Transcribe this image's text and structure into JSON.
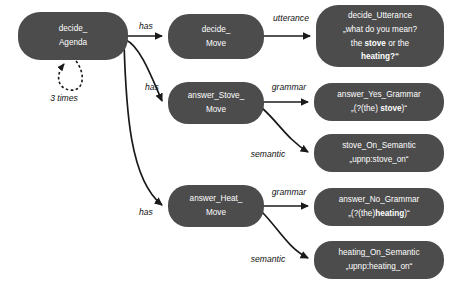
{
  "diagram": {
    "background_color": "#ffffff",
    "node_fill_color": "#4c4c4c",
    "node_text_color": "#ffffff",
    "edge_color": "#1a1a1a",
    "nodes": [
      {
        "id": "decide_agenda",
        "lines": [
          "decide_",
          "Agenda"
        ],
        "x": 18,
        "y": 12,
        "w": 110,
        "h": 48
      },
      {
        "id": "decide_move",
        "lines": [
          "decide_",
          "Move"
        ],
        "x": 168,
        "y": 14,
        "w": 96,
        "h": 45
      },
      {
        "id": "decide_utterance",
        "lines": [
          "decide_Utterance",
          "„what do you mean?",
          "the  stove  or the",
          "heating?“"
        ],
        "x": 316,
        "y": 5,
        "w": 128,
        "h": 62
      },
      {
        "id": "answer_stove_move",
        "lines": [
          "answer_Stove_",
          "Move"
        ],
        "x": 168,
        "y": 82,
        "w": 96,
        "h": 42
      },
      {
        "id": "answer_yes_grammar",
        "lines": [
          "answer_Yes_Grammar",
          "„(?(the) stove)“"
        ],
        "x": 314,
        "y": 83,
        "w": 130,
        "h": 38
      },
      {
        "id": "stove_on_semantic",
        "lines": [
          "stove_On_Semantic",
          "„upnp:stove_on“"
        ],
        "x": 314,
        "y": 134,
        "w": 130,
        "h": 38
      },
      {
        "id": "answer_heat_move",
        "lines": [
          "answer_Heat_",
          "Move"
        ],
        "x": 168,
        "y": 185,
        "w": 96,
        "h": 42
      },
      {
        "id": "answer_no_grammar",
        "lines": [
          "answer_No_Grammar",
          "„(?(the)heating)“"
        ],
        "x": 314,
        "y": 188,
        "w": 130,
        "h": 38
      },
      {
        "id": "heating_on_semantic",
        "lines": [
          "heating_On_Semantic",
          "„upnp:heating_on“"
        ],
        "x": 314,
        "y": 241,
        "w": 130,
        "h": 38
      }
    ],
    "edge_labels": [
      {
        "id": "has_1",
        "text": "has",
        "x": 146,
        "y": 27
      },
      {
        "id": "utterance_1",
        "text": "utterance",
        "x": 291,
        "y": 19
      },
      {
        "id": "has_2",
        "text": "has",
        "x": 152,
        "y": 88
      },
      {
        "id": "grammar_1",
        "text": "grammar",
        "x": 289,
        "y": 88
      },
      {
        "id": "semantic_1",
        "text": "semantic",
        "x": 268,
        "y": 155
      },
      {
        "id": "has_3",
        "text": "has",
        "x": 146,
        "y": 213
      },
      {
        "id": "grammar_2",
        "text": "grammar",
        "x": 289,
        "y": 193
      },
      {
        "id": "semantic_2",
        "text": "semantic",
        "x": 268,
        "y": 260
      }
    ],
    "loop": {
      "id": "agenda_self_loop",
      "label": "3 times",
      "label_x": 64,
      "label_y": 99
    }
  }
}
